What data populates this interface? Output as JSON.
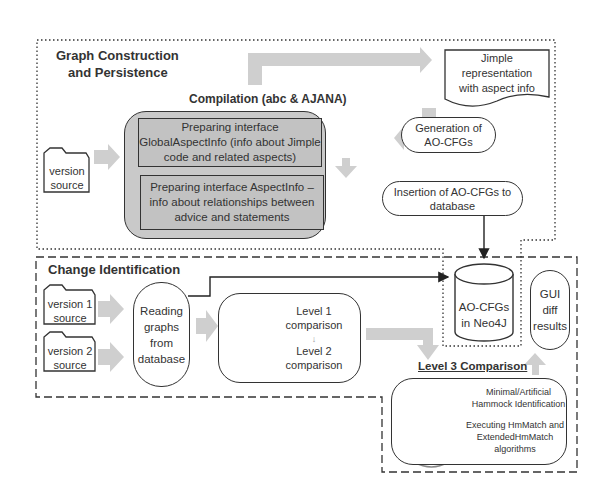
{
  "sections": {
    "graph_construction": {
      "title_line1": "Graph Construction",
      "title_line2": "and Persistence"
    },
    "change_identification": {
      "title": "Change Identification"
    }
  },
  "compilation": {
    "title": "Compilation (abc & AJANA)",
    "step1": "Preparing interface GlobalAspectInfo (info about Jimple code and related aspects)",
    "step2": "Preparing interface AspectInfo – info about relationships between advice and statements"
  },
  "inputs": {
    "version_source": {
      "line1": "version",
      "line2": "source"
    },
    "version1_source": {
      "line1": "version 1",
      "line2": "source"
    },
    "version2_source": {
      "line1": "version 2",
      "line2": "source"
    }
  },
  "nodes": {
    "jimple": {
      "line1": "Jimple",
      "line2": "representation",
      "line3": "with aspect info"
    },
    "generation": {
      "line1": "Generation of",
      "line2": "AO-CFGs"
    },
    "insertion": {
      "line1": "Insertion of AO-CFGs to",
      "line2": "database"
    },
    "database": {
      "line1": "AO-CFGs",
      "line2": "in Neo4J"
    },
    "gui": {
      "line1": "GUI",
      "line2": "diff",
      "line3": "results"
    },
    "reading": {
      "line1": "Reading",
      "line2": "graphs",
      "line3": "from",
      "line4": "database"
    },
    "level12": {
      "level1_line1": "Level 1",
      "level1_line2": "comparison",
      "level2_line1": "Level 2",
      "level2_line2": "comparison"
    },
    "level3": {
      "title": "Level 3 Comparison",
      "step1_line1": "Minimal/Artificial",
      "step1_line2": "Hammock Identification",
      "step2_line1": "Executing HmMatch and",
      "step2_line2": "ExtendedHmMatch",
      "step2_line3": "algorithms"
    }
  },
  "colors": {
    "arrow_gray": "#d0d0d0",
    "box_gray": "#c8c8c8",
    "line": "#333333"
  }
}
